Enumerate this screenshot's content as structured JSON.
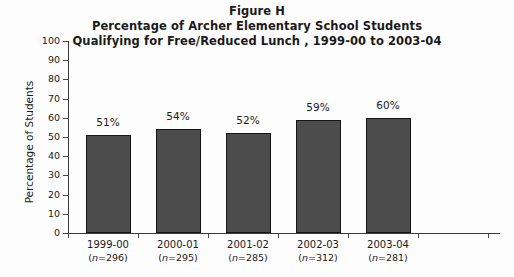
{
  "chart_data": {
    "type": "bar",
    "title": "Figure H",
    "title_lines": [
      "Figure H",
      "Percentage of Archer Elementary School Students",
      "Qualifying for Free/Reduced Lunch , 1999-00 to 2003-04"
    ],
    "subtitle": "Percentage of Archer Elementary School Students Qualifying for Free/Reduced Lunch , 1999-00 to 2003-04",
    "categories": [
      "1999-00",
      "2000-01",
      "2001-02",
      "2002-03",
      "2003-04"
    ],
    "values": [
      51,
      54,
      52,
      59,
      60
    ],
    "value_labels": [
      "51%",
      "54%",
      "52%",
      "59%",
      "60%"
    ],
    "sample_sizes": [
      "(n=296)",
      "(n=295)",
      "(n=285)",
      "(n=312)",
      "(n=281)"
    ],
    "sample_size_values": [
      296,
      295,
      285,
      312,
      281
    ],
    "xlabel": "",
    "ylabel": "Percentage of Students",
    "ylim": [
      0,
      100
    ],
    "ytick_step": 10,
    "ytick_labels": [
      "0",
      "10",
      "20",
      "30",
      "40",
      "50",
      "60",
      "70",
      "80",
      "90",
      "100"
    ],
    "grid": false,
    "legend": "none",
    "bar_color": "#4c4c4c",
    "bar_border_color": "#151515",
    "axis_color": "#3a3a3a",
    "background_color": "#fdfdfd",
    "text_color": "#1a1a1a"
  }
}
